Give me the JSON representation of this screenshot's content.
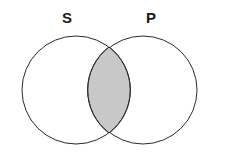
{
  "figure": {
    "type": "venn-diagram",
    "title": "",
    "background_color": "#ffffff",
    "width": 225,
    "height": 158
  },
  "sets": [
    {
      "id": "S",
      "label": "S",
      "label_x": 68,
      "label_y": 18,
      "center_x": 76,
      "center_y": 90,
      "radius": 54,
      "fill_color": "#ffffff",
      "stroke_color": "#2b2b2b",
      "stroke_width": 1
    },
    {
      "id": "P",
      "label": "P",
      "label_x": 152,
      "label_y": 18,
      "center_x": 143,
      "center_y": 90,
      "radius": 54,
      "fill_color": "#ffffff",
      "stroke_color": "#2b2b2b",
      "stroke_width": 1
    }
  ],
  "intersection": {
    "id": "S-and-P",
    "label": "",
    "shaded": true,
    "fill_color": "#c8c8c8",
    "stroke_color": "#2b2b2b",
    "top_vertex_x": 109,
    "top_vertex_y": 47,
    "bottom_vertex_x": 109,
    "bottom_vertex_y": 133,
    "left_extent_x": 89,
    "right_extent_x": 130
  }
}
